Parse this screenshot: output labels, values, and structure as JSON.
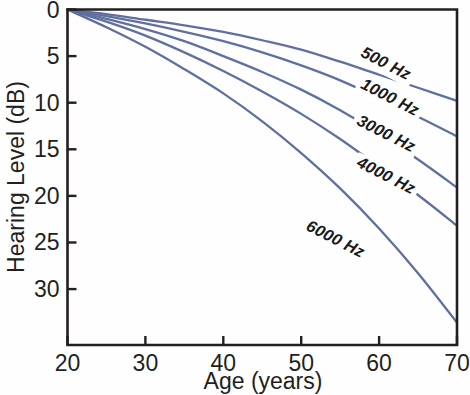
{
  "chart_data": {
    "type": "line",
    "title": "",
    "xlabel": "Age (years)",
    "ylabel": "Hearing Level (dB)",
    "xlim": [
      20,
      70
    ],
    "ylim": [
      36,
      0
    ],
    "y_inverted": true,
    "grid": false,
    "legend_position": "inline-right",
    "xticks": [
      20,
      30,
      40,
      50,
      60,
      70
    ],
    "yticks": [
      0,
      5,
      10,
      15,
      20,
      25,
      30
    ],
    "xtick_labels": [
      "20",
      "30",
      "40",
      "50",
      "60",
      "70"
    ],
    "ytick_labels": [
      "0",
      "5",
      "10",
      "15",
      "20",
      "25",
      "30"
    ],
    "line_color": "#5f6f9f",
    "axis_color": "#231f20",
    "x": [
      20,
      25,
      30,
      35,
      40,
      45,
      50,
      55,
      60,
      65,
      70
    ],
    "series": [
      {
        "name": "500 Hz",
        "label": "500 Hz",
        "values": [
          0,
          0.5,
          1.1,
          1.7,
          2.4,
          3.3,
          4.3,
          5.6,
          7.0,
          8.4,
          9.8
        ],
        "label_x": 57.5,
        "label_y": 5.0
      },
      {
        "name": "1000 Hz",
        "label": "1000 Hz",
        "values": [
          0,
          0.7,
          1.5,
          2.4,
          3.4,
          4.6,
          6.0,
          7.6,
          9.5,
          11.5,
          13.6
        ],
        "label_x": 57.5,
        "label_y": 8.4
      },
      {
        "name": "3000 Hz",
        "label": "3000 Hz",
        "values": [
          0,
          1.0,
          2.1,
          3.4,
          5.0,
          6.7,
          8.6,
          10.8,
          13.3,
          16.1,
          19.1
        ],
        "label_x": 57.0,
        "label_y": 12.3
      },
      {
        "name": "4000 Hz",
        "label": "4000 Hz",
        "values": [
          0,
          1.3,
          2.8,
          4.6,
          6.6,
          8.8,
          11.2,
          13.9,
          16.9,
          19.9,
          23.2
        ],
        "label_x": 57.0,
        "label_y": 16.8
      },
      {
        "name": "6000 Hz",
        "label": "6000 Hz",
        "values": [
          0,
          1.9,
          4.0,
          6.4,
          9.0,
          12.0,
          15.4,
          19.2,
          23.5,
          28.3,
          33.6
        ],
        "label_x": 50.5,
        "label_y": 23.6
      }
    ]
  },
  "axes": {
    "x_title": "Age (years)",
    "y_title": "Hearing Level (dB)"
  }
}
